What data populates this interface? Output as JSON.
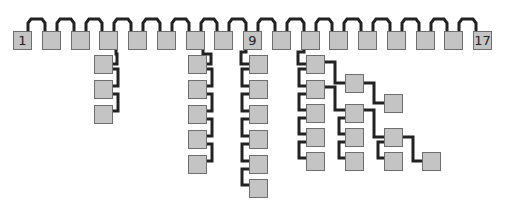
{
  "diagram": {
    "type": "linked-tree",
    "colors": {
      "box_fill": "#c4c4c4",
      "box_border": "#6e6e6e",
      "wire": "#222222",
      "background": "#ffffff"
    },
    "top_row": {
      "count": 17,
      "labels": {
        "1": "1",
        "9": "9",
        "17": "17"
      }
    },
    "labels": {
      "first": "1",
      "middle": "9",
      "last": "17"
    },
    "columns": [
      {
        "parent": 4,
        "children": 3
      },
      {
        "parent": 7,
        "children": 5
      },
      {
        "parent": 9,
        "children": 6
      },
      {
        "parent": 11,
        "children": 5,
        "branches": [
          {
            "from": "A1",
            "chain": [
              "B1",
              "C1"
            ]
          },
          {
            "from": "A2",
            "chain": [
              "B2",
              "C2",
              "D1"
            ]
          },
          {
            "from": "B2",
            "chain": [
              "B3",
              "B4"
            ]
          },
          {
            "from": "C2",
            "chain": [
              "C3"
            ]
          }
        ]
      }
    ]
  }
}
